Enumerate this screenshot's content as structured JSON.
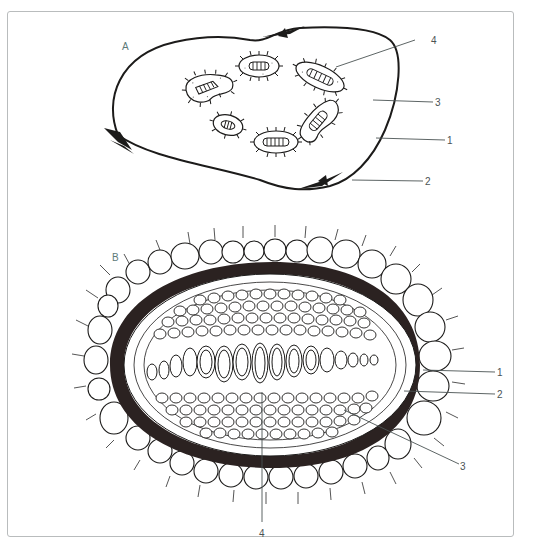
{
  "figure": {
    "frame_color": "#b9bcbd",
    "ink_color": "#1c1b1a",
    "label_color": "#4b5354",
    "panel_label_color": "#5d7a78"
  },
  "panel_a": {
    "label": "A",
    "description": "Cross-section outline with six vascular bundles",
    "callouts": [
      {
        "number": "4",
        "target": "vascular bundle"
      },
      {
        "number": "3",
        "target": "ground tissue"
      },
      {
        "number": "1",
        "target": "outer boundary"
      },
      {
        "number": "2",
        "target": "scale leaf / node"
      }
    ],
    "bundle_count": 6
  },
  "panel_b": {
    "label": "B",
    "description": "Root cross-section with epidermis, dark endodermal ring and central xylem band",
    "callouts": [
      {
        "number": "1",
        "target": "epidermal cell"
      },
      {
        "number": "2",
        "target": "pericycle"
      },
      {
        "number": "3",
        "target": "endodermis"
      },
      {
        "number": "4",
        "target": "xylem vessel"
      }
    ]
  }
}
